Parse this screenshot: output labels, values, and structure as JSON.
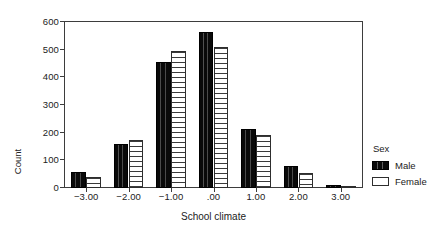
{
  "chart_data": {
    "type": "bar",
    "title": "",
    "xlabel": "School climate",
    "ylabel": "Count",
    "categories": [
      "-3.00",
      "-2.00",
      "-1.00",
      ".00",
      "1.00",
      "2.00",
      "3.00"
    ],
    "xtick_labels": [
      "−3.00",
      "−2.00",
      "−1.00",
      ".00",
      "1.00",
      "2.00",
      "3.00"
    ],
    "series": [
      {
        "name": "Male",
        "color": "#000000",
        "pattern": "solid-black",
        "values": [
          57,
          160,
          455,
          565,
          212,
          80,
          10
        ]
      },
      {
        "name": "Female",
        "color": "#ffffff",
        "pattern": "horizontal-hatch",
        "values": [
          40,
          172,
          497,
          510,
          190,
          55,
          2
        ]
      }
    ],
    "ylim": [
      0,
      600
    ],
    "ytick_labels": [
      "0",
      "100",
      "200",
      "300",
      "400",
      "500",
      "600"
    ],
    "ytick_values": [
      0,
      100,
      200,
      300,
      400,
      500,
      600
    ],
    "grid": false,
    "legend_position": "right",
    "legend": {
      "title": "Sex",
      "entries": [
        "Male",
        "Female"
      ]
    }
  },
  "legend": {
    "title": "Sex",
    "items": [
      {
        "label": "Male"
      },
      {
        "label": "Female"
      }
    ]
  },
  "axes": {
    "x_title": "School climate",
    "y_title": "Count"
  }
}
